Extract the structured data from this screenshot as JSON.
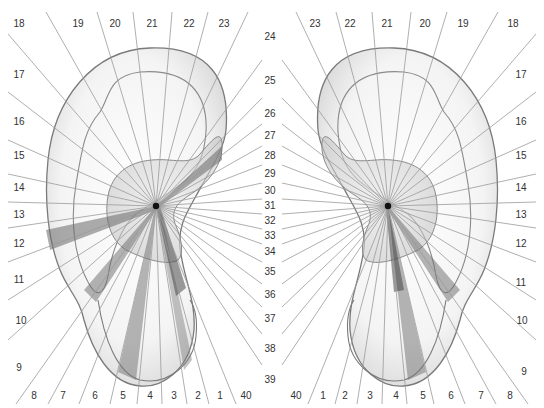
{
  "colors": {
    "ray": "#9a9a9a",
    "ear_outline": "#7a7a7a",
    "ear_fill": "#f2f2f2",
    "shade_dark": "#6a6a6a",
    "shade_mid": "#9c9c9c",
    "label": "#333333",
    "center_dot": "#111111"
  },
  "left_ear": {
    "center": [
      156,
      206
    ],
    "labels": [
      {
        "n": "18",
        "x": 19,
        "y": 24
      },
      {
        "n": "19",
        "x": 78,
        "y": 24
      },
      {
        "n": "20",
        "x": 115,
        "y": 24
      },
      {
        "n": "21",
        "x": 152,
        "y": 24
      },
      {
        "n": "22",
        "x": 189,
        "y": 24
      },
      {
        "n": "23",
        "x": 224,
        "y": 24
      },
      {
        "n": "17",
        "x": 19,
        "y": 75
      },
      {
        "n": "16",
        "x": 19,
        "y": 122
      },
      {
        "n": "15",
        "x": 19,
        "y": 156
      },
      {
        "n": "14",
        "x": 19,
        "y": 188
      },
      {
        "n": "13",
        "x": 19,
        "y": 215
      },
      {
        "n": "12",
        "x": 19,
        "y": 244
      },
      {
        "n": "11",
        "x": 19,
        "y": 280
      },
      {
        "n": "10",
        "x": 21,
        "y": 321
      },
      {
        "n": "9",
        "x": 19,
        "y": 368
      },
      {
        "n": "8",
        "x": 34,
        "y": 396
      },
      {
        "n": "7",
        "x": 63,
        "y": 396
      },
      {
        "n": "6",
        "x": 95,
        "y": 396
      },
      {
        "n": "5",
        "x": 123,
        "y": 396
      },
      {
        "n": "4",
        "x": 150,
        "y": 396
      },
      {
        "n": "3",
        "x": 174,
        "y": 396
      },
      {
        "n": "2",
        "x": 198,
        "y": 396
      },
      {
        "n": "1",
        "x": 220,
        "y": 396
      },
      {
        "n": "40",
        "x": 246,
        "y": 396
      }
    ]
  },
  "right_ear": {
    "center": [
      388,
      206
    ],
    "labels": [
      {
        "n": "23",
        "x": 315,
        "y": 24
      },
      {
        "n": "22",
        "x": 350,
        "y": 24
      },
      {
        "n": "21",
        "x": 387,
        "y": 24
      },
      {
        "n": "20",
        "x": 425,
        "y": 24
      },
      {
        "n": "19",
        "x": 463,
        "y": 24
      },
      {
        "n": "18",
        "x": 513,
        "y": 24
      },
      {
        "n": "17",
        "x": 521,
        "y": 75
      },
      {
        "n": "16",
        "x": 521,
        "y": 122
      },
      {
        "n": "15",
        "x": 521,
        "y": 156
      },
      {
        "n": "14",
        "x": 521,
        "y": 188
      },
      {
        "n": "13",
        "x": 521,
        "y": 215
      },
      {
        "n": "12",
        "x": 521,
        "y": 244
      },
      {
        "n": "11",
        "x": 521,
        "y": 283
      },
      {
        "n": "10",
        "x": 522,
        "y": 321
      },
      {
        "n": "9",
        "x": 524,
        "y": 372
      },
      {
        "n": "40",
        "x": 296,
        "y": 396
      },
      {
        "n": "1",
        "x": 323,
        "y": 396
      },
      {
        "n": "2",
        "x": 345,
        "y": 396
      },
      {
        "n": "3",
        "x": 370,
        "y": 396
      },
      {
        "n": "4",
        "x": 396,
        "y": 396
      },
      {
        "n": "5",
        "x": 423,
        "y": 396
      },
      {
        "n": "6",
        "x": 451,
        "y": 396
      },
      {
        "n": "7",
        "x": 481,
        "y": 396
      },
      {
        "n": "8",
        "x": 510,
        "y": 396
      }
    ]
  },
  "center_column": {
    "x": 270,
    "labels": [
      {
        "n": "24",
        "y": 37
      },
      {
        "n": "25",
        "y": 81
      },
      {
        "n": "26",
        "y": 114
      },
      {
        "n": "27",
        "y": 136
      },
      {
        "n": "28",
        "y": 156
      },
      {
        "n": "29",
        "y": 174
      },
      {
        "n": "30",
        "y": 191
      },
      {
        "n": "31",
        "y": 206
      },
      {
        "n": "32",
        "y": 221
      },
      {
        "n": "33",
        "y": 236
      },
      {
        "n": "34",
        "y": 252
      },
      {
        "n": "35",
        "y": 272
      },
      {
        "n": "36",
        "y": 295
      },
      {
        "n": "37",
        "y": 319
      },
      {
        "n": "38",
        "y": 349
      },
      {
        "n": "39",
        "y": 380
      }
    ]
  },
  "ray_endpoints_left": [
    [
      8,
      34
    ],
    [
      46,
      12
    ],
    [
      97,
      12
    ],
    [
      133,
      12
    ],
    [
      172,
      12
    ],
    [
      208,
      12
    ],
    [
      248,
      12
    ],
    [
      262,
      60
    ],
    [
      262,
      98
    ],
    [
      262,
      124
    ],
    [
      262,
      146
    ],
    [
      262,
      165
    ],
    [
      262,
      183
    ],
    [
      262,
      199
    ],
    [
      262,
      214
    ],
    [
      262,
      229
    ],
    [
      262,
      244
    ],
    [
      262,
      262
    ],
    [
      262,
      284
    ],
    [
      262,
      307
    ],
    [
      262,
      334
    ],
    [
      262,
      365
    ],
    [
      236,
      404
    ],
    [
      209,
      404
    ],
    [
      187,
      404
    ],
    [
      162,
      404
    ],
    [
      137,
      404
    ],
    [
      110,
      404
    ],
    [
      79,
      404
    ],
    [
      48,
      404
    ],
    [
      16,
      404
    ],
    [
      8,
      340
    ],
    [
      8,
      300
    ],
    [
      8,
      262
    ],
    [
      8,
      228
    ],
    [
      8,
      202
    ],
    [
      8,
      174
    ],
    [
      8,
      140
    ],
    [
      8,
      92
    ]
  ],
  "ray_endpoints_right": [
    [
      536,
      34
    ],
    [
      498,
      12
    ],
    [
      447,
      12
    ],
    [
      411,
      12
    ],
    [
      372,
      12
    ],
    [
      336,
      12
    ],
    [
      296,
      12
    ],
    [
      282,
      60
    ],
    [
      282,
      98
    ],
    [
      282,
      124
    ],
    [
      282,
      146
    ],
    [
      282,
      165
    ],
    [
      282,
      183
    ],
    [
      282,
      199
    ],
    [
      282,
      214
    ],
    [
      282,
      229
    ],
    [
      282,
      244
    ],
    [
      282,
      262
    ],
    [
      282,
      284
    ],
    [
      282,
      307
    ],
    [
      282,
      334
    ],
    [
      282,
      365
    ],
    [
      308,
      404
    ],
    [
      335,
      404
    ],
    [
      357,
      404
    ],
    [
      382,
      404
    ],
    [
      407,
      404
    ],
    [
      434,
      404
    ],
    [
      465,
      404
    ],
    [
      496,
      404
    ],
    [
      528,
      404
    ],
    [
      536,
      340
    ],
    [
      536,
      300
    ],
    [
      536,
      262
    ],
    [
      536,
      228
    ],
    [
      536,
      202
    ],
    [
      536,
      174
    ],
    [
      536,
      140
    ],
    [
      536,
      92
    ]
  ]
}
